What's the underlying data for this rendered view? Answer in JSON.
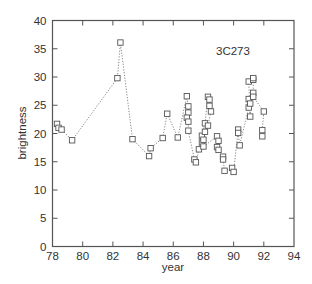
{
  "chart_data": {
    "type": "line",
    "title": "",
    "annotation": "3C273",
    "xlabel": "year",
    "ylabel": "brightness",
    "xlim": [
      78,
      94
    ],
    "ylim": [
      0,
      40
    ],
    "xticks": [
      78,
      80,
      82,
      84,
      86,
      88,
      90,
      92,
      94
    ],
    "yticks": [
      0,
      5,
      10,
      15,
      20,
      25,
      30,
      35,
      40
    ],
    "grid": false,
    "legend": null,
    "marker": "open-square",
    "line_style": "dotted",
    "series": [
      {
        "name": "3C273",
        "points": [
          [
            78.3,
            21.7
          ],
          [
            78.4,
            21.0
          ],
          [
            78.6,
            20.7
          ],
          [
            79.3,
            18.8
          ],
          [
            82.3,
            29.8
          ],
          [
            82.5,
            36.1
          ],
          [
            83.3,
            19.0
          ],
          [
            84.4,
            16.0
          ],
          [
            84.5,
            17.4
          ],
          [
            85.3,
            19.2
          ],
          [
            85.6,
            23.5
          ],
          [
            86.3,
            19.3
          ],
          [
            86.9,
            26.6
          ],
          [
            87.0,
            24.8
          ],
          [
            87.0,
            23.7
          ],
          [
            86.9,
            22.8
          ],
          [
            87.0,
            22.1
          ],
          [
            87.0,
            20.5
          ],
          [
            87.4,
            15.4
          ],
          [
            87.5,
            14.9
          ],
          [
            87.7,
            17.2
          ],
          [
            87.9,
            18.4
          ],
          [
            87.9,
            19.6
          ],
          [
            88.1,
            21.8
          ],
          [
            88.3,
            26.5
          ],
          [
            88.4,
            26.0
          ],
          [
            88.4,
            24.9
          ],
          [
            88.5,
            23.9
          ],
          [
            88.3,
            21.4
          ],
          [
            88.1,
            20.3
          ],
          [
            88.0,
            18.9
          ],
          [
            88.0,
            17.7
          ],
          [
            88.9,
            19.5
          ],
          [
            89.0,
            18.7
          ],
          [
            88.9,
            17.6
          ],
          [
            89.0,
            17.1
          ],
          [
            89.3,
            15.9
          ],
          [
            89.3,
            15.4
          ],
          [
            89.4,
            13.4
          ],
          [
            89.9,
            13.9
          ],
          [
            90.0,
            13.2
          ],
          [
            90.3,
            20.7
          ],
          [
            90.3,
            20.1
          ],
          [
            90.4,
            17.9
          ],
          [
            91.0,
            24.6
          ],
          [
            91.0,
            26.1
          ],
          [
            91.1,
            25.3
          ],
          [
            91.1,
            23.0
          ],
          [
            91.0,
            29.2
          ],
          [
            91.3,
            29.5
          ],
          [
            91.3,
            29.8
          ],
          [
            91.3,
            27.2
          ],
          [
            91.3,
            26.5
          ],
          [
            92.0,
            23.9
          ],
          [
            91.9,
            20.6
          ],
          [
            91.9,
            19.5
          ]
        ]
      }
    ]
  },
  "labels": {
    "annotation": "3C273",
    "xlabel": "year",
    "ylabel": "brightness"
  },
  "colors": {
    "axis": "#555555",
    "marker": "#555555",
    "line": "#777777",
    "text": "#333333"
  }
}
